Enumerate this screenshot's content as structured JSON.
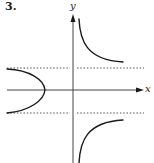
{
  "problem": {
    "number": "3."
  },
  "axes": {
    "x_label": "x",
    "y_label": "y"
  },
  "asymptotes": {
    "style": "dotted",
    "count": 2,
    "orientation": "horizontal"
  },
  "curves": {
    "description": "Graph with a right branch split by horizontal asymptotes (upper-right decreasing toward asymptote, lower-right increasing toward asymptote) and a left-opening parabola-like branch crossing the negative x-axis",
    "branches": [
      "upper-right",
      "lower-right",
      "left-arc"
    ]
  },
  "colors": {
    "ink": "#1a1a1a",
    "axis": "#444444",
    "dotted": "#555555"
  }
}
